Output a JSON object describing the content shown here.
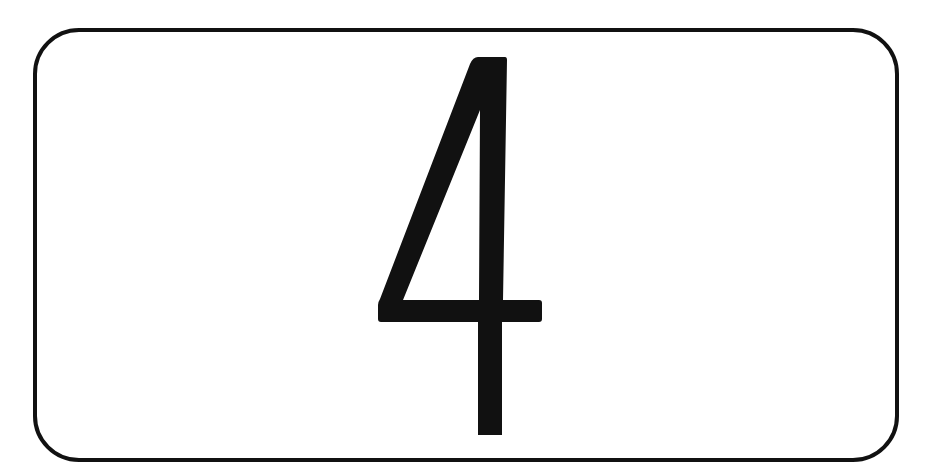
{
  "sign": {
    "number": "4",
    "border_color": "#111111",
    "glyph_color": "#111111",
    "background_color": "#ffffff"
  }
}
